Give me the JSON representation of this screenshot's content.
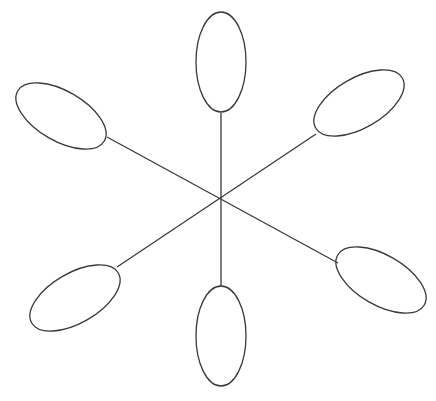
{
  "figure": {
    "width": 436,
    "height": 401,
    "background_color": "#ffffff",
    "stroke_color": "#3a3a3a",
    "stroke_width": 1.3,
    "center": {
      "x": 221,
      "y": 199
    }
  },
  "chart_data": {
    "type": "scatter",
    "xlabel": "",
    "ylabel": "",
    "xlim": [
      0,
      436
    ],
    "ylim": [
      0,
      401
    ],
    "grid": false,
    "legend": "none",
    "center": {
      "x": 221,
      "y": 199
    },
    "lobe_count": 6,
    "angle_step_deg": 60,
    "lobes": [
      {
        "name": "lobe-top",
        "angle_deg": 90,
        "cx": 221,
        "cy": 62,
        "rx": 25,
        "ry": 50,
        "rotation_deg": 0,
        "spoke": {
          "x1": 221,
          "y1": 199,
          "x2": 221,
          "y2": 113
        }
      },
      {
        "name": "lobe-upper-right",
        "angle_deg": 30,
        "cx": 359,
        "cy": 103,
        "rx": 50,
        "ry": 25,
        "rotation_deg": -30,
        "spoke": {
          "x1": 221,
          "y1": 199,
          "x2": 316,
          "y2": 134
        }
      },
      {
        "name": "lobe-lower-right",
        "angle_deg": -30,
        "cx": 381,
        "cy": 280,
        "rx": 50,
        "ry": 25,
        "rotation_deg": 30,
        "spoke": {
          "x1": 221,
          "y1": 199,
          "x2": 338,
          "y2": 263
        }
      },
      {
        "name": "lobe-bottom",
        "angle_deg": -90,
        "cx": 221,
        "cy": 336,
        "rx": 25,
        "ry": 50,
        "rotation_deg": 0,
        "spoke": {
          "x1": 221,
          "y1": 199,
          "x2": 221,
          "y2": 286
        }
      },
      {
        "name": "lobe-lower-left",
        "angle_deg": -150,
        "cx": 75,
        "cy": 298,
        "rx": 50,
        "ry": 25,
        "rotation_deg": -30,
        "spoke": {
          "x1": 221,
          "y1": 199,
          "x2": 117,
          "y2": 267
        }
      },
      {
        "name": "lobe-upper-left",
        "angle_deg": 150,
        "cx": 61,
        "cy": 116,
        "rx": 50,
        "ry": 25,
        "rotation_deg": 30,
        "spoke": {
          "x1": 221,
          "y1": 199,
          "x2": 107,
          "y2": 137
        }
      }
    ],
    "spokes": [
      {
        "name": "spoke-vertical",
        "x1": 221,
        "y1": 113,
        "x2": 221,
        "y2": 286
      },
      {
        "name": "spoke-upper-left-to-lower-right",
        "x1": 107,
        "y1": 137,
        "x2": 338,
        "y2": 263
      },
      {
        "name": "spoke-upper-right-to-lower-left",
        "x1": 316,
        "y1": 134,
        "x2": 117,
        "y2": 267
      }
    ]
  }
}
